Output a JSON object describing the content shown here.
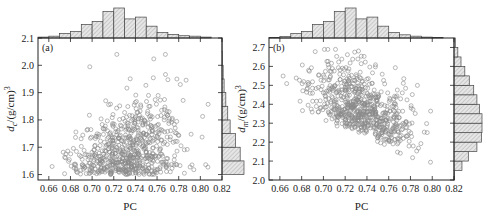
{
  "chart_data": [
    {
      "type": "scatter",
      "panel_label": "(a)",
      "xlabel": "PC",
      "ylabel": "d_c/(g/cm)^3",
      "ylabel_main": "d",
      "ylabel_sub": "c",
      "ylabel_rest": "/(g/cm)",
      "ylabel_sup": "3",
      "xlim": [
        0.65,
        0.82
      ],
      "ylim": [
        1.58,
        2.1
      ],
      "xticks": [
        0.66,
        0.68,
        0.7,
        0.72,
        0.74,
        0.76,
        0.78,
        0.8,
        0.82
      ],
      "xtick_labels": [
        "0.66",
        "0.68",
        "0.70",
        "0.72",
        "0.74",
        "0.76",
        "0.78",
        "0.80",
        "0.82"
      ],
      "yticks": [
        1.6,
        1.7,
        1.8,
        1.9,
        2.0,
        2.1
      ],
      "ytick_labels": [
        "1.6",
        "1.7",
        "1.8",
        "1.9",
        "2.0",
        "2.1"
      ],
      "marker": "open-circle",
      "point_color": "#8a8a8a",
      "distribution": {
        "x_mean": 0.735,
        "x_sd": 0.024,
        "y_min": 1.6,
        "y_mode": 1.62,
        "y_max": 2.04,
        "approx_points": 700,
        "trend": "positive correlation, dense cluster near 1.6-1.75 at PC 0.72-0.75"
      },
      "top_histogram": {
        "bin_edges": [
          0.65,
          0.66,
          0.67,
          0.68,
          0.69,
          0.7,
          0.71,
          0.72,
          0.73,
          0.74,
          0.75,
          0.76,
          0.77,
          0.78,
          0.79,
          0.8,
          0.81,
          0.82
        ],
        "counts": [
          2,
          4,
          10,
          14,
          30,
          36,
          58,
          66,
          42,
          46,
          26,
          12,
          8,
          5,
          4,
          2
        ]
      },
      "right_histogram": {
        "bin_edges": [
          1.6,
          1.65,
          1.7,
          1.75,
          1.8,
          1.85,
          1.9,
          1.95,
          2.0,
          2.05,
          2.1
        ],
        "counts": [
          230,
          190,
          140,
          85,
          60,
          40,
          22,
          12,
          4,
          1
        ]
      }
    },
    {
      "type": "scatter",
      "panel_label": "(b)",
      "xlabel": "PC",
      "ylabel": "d_m/(g/cm)^3",
      "ylabel_main": "d",
      "ylabel_sub": "m",
      "ylabel_rest": "/(g/cm)",
      "ylabel_sup": "3",
      "xlim": [
        0.65,
        0.82
      ],
      "ylim": [
        2.0,
        2.75
      ],
      "xticks": [
        0.66,
        0.68,
        0.7,
        0.72,
        0.74,
        0.76,
        0.78,
        0.8,
        0.82
      ],
      "xtick_labels": [
        "0.66",
        "0.68",
        "0.70",
        "0.72",
        "0.74",
        "0.76",
        "0.78",
        "0.80",
        "0.82"
      ],
      "yticks": [
        2.0,
        2.1,
        2.2,
        2.3,
        2.4,
        2.5,
        2.6,
        2.7
      ],
      "ytick_labels": [
        "2.0",
        "2.1",
        "2.2",
        "2.3",
        "2.4",
        "2.5",
        "2.6",
        "2.7"
      ],
      "marker": "open-circle",
      "point_color": "#8a8a8a",
      "distribution": {
        "x_mean": 0.735,
        "x_sd": 0.024,
        "y_center": 2.3,
        "approx_points": 700,
        "trend": "lower boundary descends from ~2.35 at PC 0.68 to ~2.05 at PC 0.80"
      },
      "top_histogram": {
        "bin_edges": [
          0.65,
          0.66,
          0.67,
          0.68,
          0.69,
          0.7,
          0.71,
          0.72,
          0.73,
          0.74,
          0.75,
          0.76,
          0.77,
          0.78,
          0.79,
          0.8,
          0.81,
          0.82
        ],
        "counts": [
          1,
          3,
          10,
          14,
          30,
          36,
          58,
          66,
          42,
          46,
          26,
          12,
          7,
          4,
          2,
          1
        ]
      },
      "right_histogram": {
        "bin_edges": [
          2.0,
          2.05,
          2.1,
          2.15,
          2.2,
          2.25,
          2.3,
          2.35,
          2.4,
          2.45,
          2.5,
          2.55,
          2.6,
          2.65,
          2.7,
          2.75
        ],
        "counts": [
          2,
          25,
          45,
          72,
          86,
          88,
          88,
          80,
          72,
          62,
          48,
          34,
          22,
          12,
          4
        ]
      }
    }
  ]
}
